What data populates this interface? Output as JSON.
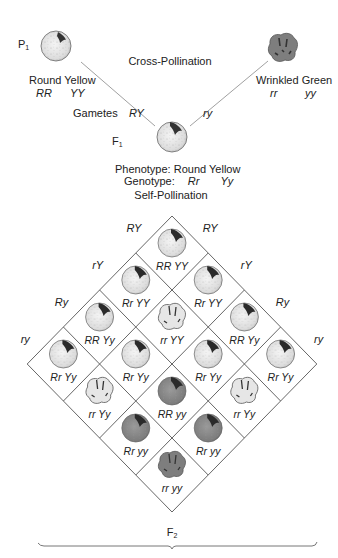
{
  "parents": {
    "label": "P",
    "label_sub": "1",
    "left": {
      "phenotype": "Round Yellow",
      "genotype_r": "RR",
      "genotype_y": "YY",
      "shape": "round",
      "color": "yellow"
    },
    "right": {
      "phenotype": "Wrinkled Green",
      "genotype_r": "rr",
      "genotype_y": "yy",
      "shape": "wrinkled",
      "color": "green"
    },
    "cross_label": "Cross-Pollination"
  },
  "gametes": {
    "label": "Gametes",
    "left": "RY",
    "right": "ry"
  },
  "f1": {
    "label": "F",
    "label_sub": "1",
    "phenotype_label": "Phenotype:",
    "phenotype_value": "Round Yellow",
    "genotype_label": "Genotype:",
    "genotype_r": "Rr",
    "genotype_y": "Yy",
    "self_label": "Self-Pollination"
  },
  "punnett": {
    "left_gametes": [
      "RY",
      "rY",
      "Ry",
      "ry"
    ],
    "right_gametes": [
      "RY",
      "rY",
      "Ry",
      "ry"
    ],
    "cells": [
      {
        "row": 0,
        "col": 0,
        "genotype": "RR YY",
        "shape": "round",
        "color": "yellow"
      },
      {
        "row": 1,
        "col": 0,
        "genotype": "Rr YY",
        "shape": "round",
        "color": "yellow"
      },
      {
        "row": 0,
        "col": 1,
        "genotype": "Rr YY",
        "shape": "round",
        "color": "yellow"
      },
      {
        "row": 2,
        "col": 0,
        "genotype": "RR Yy",
        "shape": "round",
        "color": "yellow"
      },
      {
        "row": 1,
        "col": 1,
        "genotype": "rr YY",
        "shape": "wrinkled",
        "color": "yellow"
      },
      {
        "row": 0,
        "col": 2,
        "genotype": "RR Yy",
        "shape": "round",
        "color": "yellow"
      },
      {
        "row": 3,
        "col": 0,
        "genotype": "Rr Yy",
        "shape": "round",
        "color": "yellow"
      },
      {
        "row": 2,
        "col": 1,
        "genotype": "Rr Yy",
        "shape": "round",
        "color": "yellow"
      },
      {
        "row": 1,
        "col": 2,
        "genotype": "Rr Yy",
        "shape": "round",
        "color": "yellow"
      },
      {
        "row": 0,
        "col": 3,
        "genotype": "Rr Yy",
        "shape": "round",
        "color": "yellow"
      },
      {
        "row": 3,
        "col": 1,
        "genotype": "rr Yy",
        "shape": "wrinkled",
        "color": "yellow"
      },
      {
        "row": 2,
        "col": 2,
        "genotype": "RR yy",
        "shape": "round",
        "color": "green"
      },
      {
        "row": 1,
        "col": 3,
        "genotype": "rr Yy",
        "shape": "wrinkled",
        "color": "yellow"
      },
      {
        "row": 3,
        "col": 2,
        "genotype": "Rr yy",
        "shape": "round",
        "color": "green"
      },
      {
        "row": 2,
        "col": 3,
        "genotype": "Rr yy",
        "shape": "round",
        "color": "green"
      },
      {
        "row": 3,
        "col": 3,
        "genotype": "rr yy",
        "shape": "wrinkled",
        "color": "green"
      }
    ]
  },
  "f2": {
    "label": "F",
    "label_sub": "2"
  },
  "colors": {
    "yellow_seed": "#e8e8e8",
    "green_seed": "#8a8a8a",
    "line": "#555555",
    "text": "#222222"
  }
}
